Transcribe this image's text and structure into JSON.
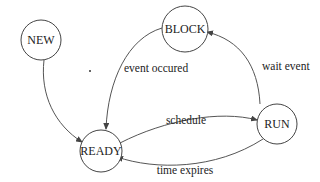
{
  "diagram": {
    "type": "state-transition",
    "states": [
      {
        "id": "new",
        "label": "NEW"
      },
      {
        "id": "block",
        "label": "BLOCK"
      },
      {
        "id": "ready",
        "label": "READY"
      },
      {
        "id": "run",
        "label": "RUN"
      }
    ],
    "transitions": [
      {
        "from": "new",
        "to": "ready",
        "label": ""
      },
      {
        "from": "block",
        "to": "ready",
        "label": "event occured"
      },
      {
        "from": "ready",
        "to": "run",
        "label": "schedule"
      },
      {
        "from": "run",
        "to": "ready",
        "label": "time expires"
      },
      {
        "from": "run",
        "to": "block",
        "label": "wait event"
      }
    ]
  },
  "colors": {
    "stroke": "#444444",
    "text": "#222222",
    "background": "#ffffff"
  }
}
